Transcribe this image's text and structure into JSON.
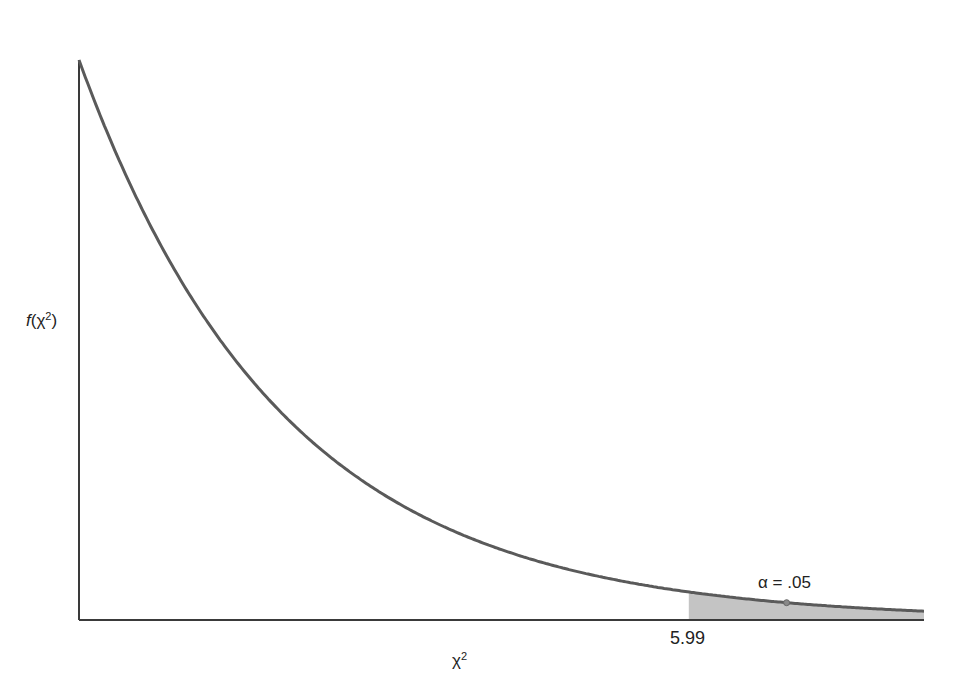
{
  "chart_data": {
    "type": "area",
    "title": "",
    "xlabel": "χ²",
    "ylabel": "f(χ²)",
    "df": 2,
    "x": [
      0,
      0.25,
      0.5,
      1,
      1.5,
      2,
      3,
      4,
      5,
      5.99,
      7,
      8.3
    ],
    "values": [
      0.5,
      0.441,
      0.389,
      0.303,
      0.236,
      0.184,
      0.112,
      0.068,
      0.041,
      0.025,
      0.015,
      0.008
    ],
    "xlim": [
      0,
      8.3
    ],
    "ylim": [
      0,
      0.5
    ],
    "grid": false,
    "legend": "none",
    "critical_value": 5.99,
    "critical_value_label": "5.99",
    "shaded_region": {
      "from": 5.99,
      "to": 8.3,
      "label": "α = .05"
    }
  },
  "labels": {
    "y_axis_func": "f",
    "y_axis_open": "(",
    "y_axis_var": "χ",
    "y_axis_sup": "2",
    "y_axis_close": ")",
    "x_axis_var": "χ",
    "x_axis_sup": "2",
    "critical_value": "5.99",
    "alpha": "α = .05"
  },
  "colors": {
    "curve": "#5a5a5a",
    "axis": "#3a3a3a",
    "shade": "#c4c4c4"
  }
}
